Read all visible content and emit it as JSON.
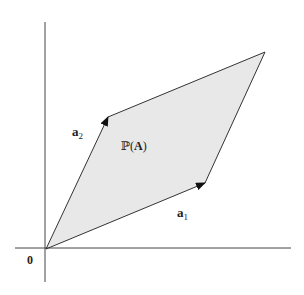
{
  "diagram": {
    "type": "parallelogram-vectors",
    "colors": {
      "background": "#ffffff",
      "axis": "#444444",
      "edge": "#333333",
      "fill": "#e8e8e8",
      "arrow": "#111111",
      "text": "#222222"
    },
    "axes": {
      "x_axis": {
        "x1": 15,
        "y1": 248,
        "x2": 291,
        "y2": 248
      },
      "y_axis": {
        "x1": 45,
        "y1": 22,
        "x2": 45,
        "y2": 282
      }
    },
    "origin": {
      "x": 46,
      "y": 249
    },
    "vertices": {
      "origin": {
        "x": 46,
        "y": 249
      },
      "a1_tip": {
        "x": 205,
        "y": 183
      },
      "a1_plus_a2": {
        "x": 265,
        "y": 52
      },
      "a2_tip": {
        "x": 108,
        "y": 117
      }
    },
    "labels": {
      "origin": "0",
      "a1_base": "a",
      "a1_sub": "1",
      "a2_base": "a",
      "a2_sub": "2",
      "region_prefix": "ℙ(",
      "region_matrix": "A",
      "region_suffix": ")"
    }
  }
}
